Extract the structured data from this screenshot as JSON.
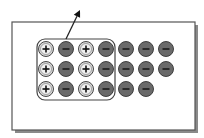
{
  "diagram": {
    "colors": {
      "background": "#ffffff",
      "panel_border": "#555555",
      "panel_shadow": "#888888",
      "positive_fill": "#d8d8d8",
      "negative_fill": "#6a6a6a",
      "stroke": "#333333",
      "group_border": "#444444",
      "arrow": "#222222"
    },
    "grid": {
      "columns_x": [
        46,
        66,
        86,
        106,
        126,
        146,
        166
      ],
      "rows_y": [
        49,
        69,
        89
      ],
      "radius": 7.5
    },
    "charges": [
      [
        "+",
        "-",
        "+",
        "-",
        "-",
        "-",
        "-"
      ],
      [
        "+",
        "-",
        "+",
        "-",
        "-",
        "-",
        "-"
      ],
      [
        "+",
        "-",
        "+",
        "-",
        "-",
        "-",
        ""
      ]
    ],
    "group": {
      "x": 37,
      "y": 39,
      "width": 78,
      "height": 61,
      "rx": 8,
      "label": "selected-charge-group"
    },
    "arrow": {
      "x1": 66,
      "y1": 39,
      "x2": 80,
      "y2": 10
    }
  }
}
